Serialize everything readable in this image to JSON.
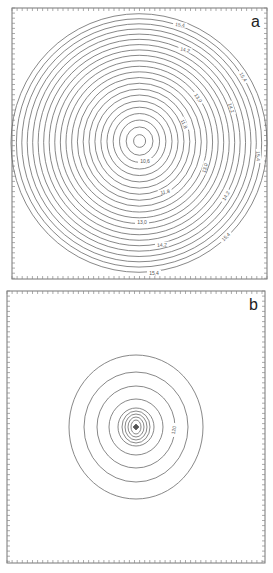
{
  "chart_data": [
    {
      "type": "contour",
      "panel_label": "a",
      "frame": {
        "x": 12,
        "y": 8,
        "width": 255,
        "height": 271
      },
      "center": {
        "x": 139,
        "y": 143
      },
      "ring_count": 22,
      "inner_radius": 6,
      "outer_radius": 128,
      "ellipse_aspect": 1.06,
      "contour_labels": [
        {
          "text": "15,4",
          "x": 180,
          "y": 25,
          "angle": 8
        },
        {
          "text": "14,2",
          "x": 185,
          "y": 50,
          "angle": 12
        },
        {
          "text": "15,4",
          "x": 243,
          "y": 77,
          "angle": 60
        },
        {
          "text": "13,0",
          "x": 198,
          "y": 98,
          "angle": 55
        },
        {
          "text": "14,2",
          "x": 231,
          "y": 108,
          "angle": 72
        },
        {
          "text": "11,8",
          "x": 184,
          "y": 124,
          "angle": 65
        },
        {
          "text": "15,4",
          "x": 258,
          "y": 156,
          "angle": 88
        },
        {
          "text": "10,6",
          "x": 145,
          "y": 161,
          "angle": 0
        },
        {
          "text": "13,0",
          "x": 205,
          "y": 168,
          "angle": -75
        },
        {
          "text": "11,8",
          "x": 165,
          "y": 192,
          "angle": -10
        },
        {
          "text": "14,2",
          "x": 226,
          "y": 196,
          "angle": -60
        },
        {
          "text": "13,0",
          "x": 142,
          "y": 222,
          "angle": 0
        },
        {
          "text": "15,4",
          "x": 226,
          "y": 237,
          "angle": -45
        },
        {
          "text": "14,2",
          "x": 162,
          "y": 245,
          "angle": -4
        },
        {
          "text": "15,4",
          "x": 154,
          "y": 273,
          "angle": 0
        }
      ],
      "xlabel": "",
      "ylabel": "",
      "grid": false
    },
    {
      "type": "contour",
      "panel_label": "b",
      "frame": {
        "x": 7,
        "y": 291,
        "width": 258,
        "height": 272
      },
      "center": {
        "x": 136,
        "y": 427
      },
      "rings": [
        {
          "rx": 2.5,
          "ry": 2.5
        },
        {
          "rx": 5,
          "ry": 7
        },
        {
          "rx": 8,
          "ry": 10
        },
        {
          "rx": 11,
          "ry": 13
        },
        {
          "rx": 14,
          "ry": 16
        },
        {
          "rx": 18,
          "ry": 19
        },
        {
          "rx": 27,
          "ry": 28
        },
        {
          "rx": 39,
          "ry": 41
        },
        {
          "rx": 52,
          "ry": 55
        },
        {
          "rx": 67,
          "ry": 72
        }
      ],
      "contour_labels": [
        {
          "text": "120",
          "x": 174,
          "y": 430,
          "angle": -80
        }
      ],
      "xlabel": "",
      "ylabel": "",
      "grid": false
    }
  ]
}
